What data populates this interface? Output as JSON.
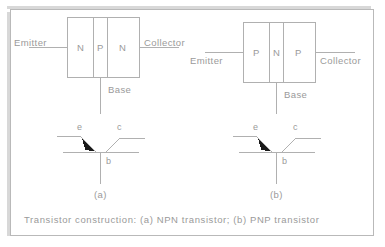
{
  "figure": {
    "caption": "Transistor construction:  (a)  NPN transistor;  (b)  PNP transistor",
    "border_color": "#b9b9b9",
    "line_color": "#b0b0b0",
    "text_color": "#9a9a9a",
    "arrow_color": "#1a1a1a",
    "background": "#ffffff"
  },
  "panels": [
    {
      "id": "a",
      "sub_label": "(a)",
      "type": "NPN",
      "construction": {
        "emitter_label": "Emitter",
        "collector_label": "Collector",
        "base_label": "Base",
        "regions": [
          "N",
          "P",
          "N"
        ]
      },
      "symbol": {
        "emitter_label": "e",
        "collector_label": "c",
        "base_label": "b"
      }
    },
    {
      "id": "b",
      "sub_label": "(b)",
      "type": "PNP",
      "construction": {
        "emitter_label": "Emitter",
        "collector_label": "Collector",
        "base_label": "Base",
        "regions": [
          "P",
          "N",
          "P"
        ]
      },
      "symbol": {
        "emitter_label": "e",
        "collector_label": "c",
        "base_label": "b"
      }
    }
  ]
}
